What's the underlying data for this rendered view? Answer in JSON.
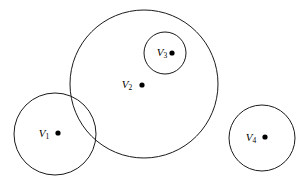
{
  "diagram": {
    "type": "circle-containment-diagram",
    "background_color": "#ffffff",
    "stroke_color": "#1a1a1a",
    "dot_color": "#000000",
    "width": 308,
    "height": 182,
    "nodes": [
      {
        "id": "v1",
        "label_base": "V",
        "label_sub": "1",
        "label_full": "V1",
        "circle": {
          "cx": 55,
          "cy": 134,
          "r": 41
        },
        "dot": {
          "cx": 58,
          "cy": 133,
          "r": 2.6
        },
        "label_pos": {
          "x": 44,
          "y": 134
        }
      },
      {
        "id": "v2",
        "label_base": "V",
        "label_sub": "2",
        "label_full": "V2",
        "circle": {
          "cx": 144,
          "cy": 84,
          "r": 74
        },
        "dot": {
          "cx": 142,
          "cy": 85,
          "r": 2.6
        },
        "label_pos": {
          "x": 127,
          "y": 85
        }
      },
      {
        "id": "v3",
        "label_base": "V",
        "label_sub": "3",
        "label_full": "V3",
        "circle": {
          "cx": 165,
          "cy": 53,
          "r": 21
        },
        "dot": {
          "cx": 172,
          "cy": 53,
          "r": 2.6
        },
        "label_pos": {
          "x": 162,
          "y": 53
        }
      },
      {
        "id": "v4",
        "label_base": "V",
        "label_sub": "4",
        "label_full": "V4",
        "circle": {
          "cx": 262,
          "cy": 138,
          "r": 33
        },
        "dot": {
          "cx": 265,
          "cy": 137,
          "r": 2.6
        },
        "label_pos": {
          "x": 251,
          "y": 138
        }
      }
    ],
    "relations": {
      "contained": [
        {
          "inner": "v3",
          "outer": "v2"
        }
      ],
      "overlapping": [
        {
          "a": "v1",
          "b": "v2"
        }
      ],
      "disjoint": [
        {
          "a": "v4",
          "b": "v1"
        },
        {
          "a": "v4",
          "b": "v2"
        }
      ]
    }
  }
}
